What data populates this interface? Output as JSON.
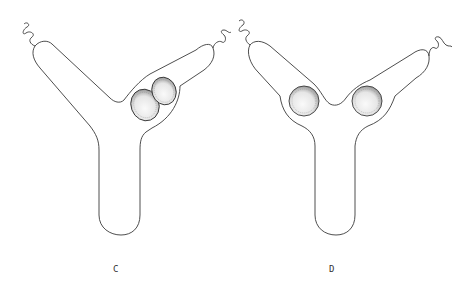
{
  "figure": {
    "panels": [
      {
        "id": "C",
        "label": "C",
        "description": "Y-shaped cell with two spores in right arm near junction"
      },
      {
        "id": "D",
        "label": "D",
        "description": "Y-shaped cell with one spore in each arm near junction"
      }
    ],
    "colors": {
      "stroke": "#3a3a3a",
      "spore_fill": "#e8e8e8",
      "background": "#ffffff"
    }
  }
}
